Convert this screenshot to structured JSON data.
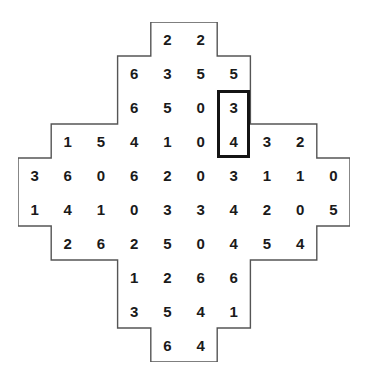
{
  "puzzle": {
    "name": "number-domino-grid",
    "grid_rows": 10,
    "grid_cols": 10,
    "outline_color": "#555555",
    "highlight_color": "#141414",
    "digit_color": "#1a1a1a",
    "background_color": "#ffffff",
    "rows": [
      {
        "index": 0,
        "start_col": 4,
        "values": [
          "2",
          "2"
        ]
      },
      {
        "index": 1,
        "start_col": 3,
        "values": [
          "6",
          "3",
          "5",
          "5"
        ]
      },
      {
        "index": 2,
        "start_col": 3,
        "values": [
          "6",
          "5",
          "0",
          "3"
        ]
      },
      {
        "index": 3,
        "start_col": 1,
        "values": [
          "1",
          "5",
          "4",
          "1",
          "0",
          "4",
          "3",
          "2"
        ]
      },
      {
        "index": 4,
        "start_col": 0,
        "values": [
          "3",
          "6",
          "0",
          "6",
          "2",
          "0",
          "3",
          "1",
          "1",
          "0"
        ]
      },
      {
        "index": 5,
        "start_col": 0,
        "values": [
          "1",
          "4",
          "1",
          "0",
          "3",
          "3",
          "4",
          "2",
          "0",
          "5"
        ]
      },
      {
        "index": 6,
        "start_col": 1,
        "values": [
          "2",
          "6",
          "2",
          "5",
          "0",
          "4",
          "5",
          "4"
        ]
      },
      {
        "index": 7,
        "start_col": 3,
        "values": [
          "1",
          "2",
          "6",
          "6"
        ]
      },
      {
        "index": 8,
        "start_col": 3,
        "values": [
          "3",
          "5",
          "4",
          "1"
        ]
      },
      {
        "index": 9,
        "start_col": 4,
        "values": [
          "6",
          "4"
        ]
      }
    ],
    "highlight": {
      "label": "selected-domino",
      "col": 6,
      "row_start": 2,
      "row_end": 3,
      "span_rows": 2,
      "span_cols": 1,
      "values": [
        "3",
        "4"
      ]
    }
  }
}
